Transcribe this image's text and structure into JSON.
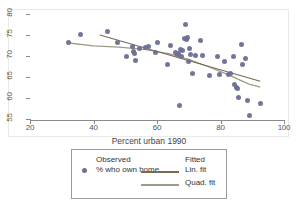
{
  "chart_data": {
    "type": "scatter",
    "title": "",
    "xlabel": "Percent urban 1990",
    "ylabel": "",
    "xlim": [
      20,
      100
    ],
    "ylim": [
      55,
      80
    ],
    "xticks": [
      20,
      40,
      60,
      80,
      100
    ],
    "yticks": [
      55,
      60,
      65,
      70,
      75,
      80
    ],
    "grid": false,
    "legend_position": "below-axes",
    "series": [
      {
        "name": "% who own home",
        "type": "scatter",
        "marker": "filled-circle",
        "color": "#6b6f93",
        "points": [
          [
            32.2,
            73.1
          ],
          [
            36.0,
            75.2
          ],
          [
            44.5,
            75.9
          ],
          [
            47.5,
            73.1
          ],
          [
            50.3,
            69.9
          ],
          [
            52.3,
            72.3
          ],
          [
            52.6,
            71.1
          ],
          [
            53.0,
            70.5
          ],
          [
            53.2,
            69.0
          ],
          [
            54.5,
            71.8
          ],
          [
            56.4,
            72.0
          ],
          [
            57.2,
            72.3
          ],
          [
            59.5,
            70.8
          ],
          [
            60.3,
            73.3
          ],
          [
            63.2,
            67.9
          ],
          [
            64.4,
            72.5
          ],
          [
            65.8,
            70.9
          ],
          [
            66.3,
            70.3
          ],
          [
            66.7,
            70.6
          ],
          [
            67.0,
            58.1
          ],
          [
            67.3,
            71.6
          ],
          [
            67.6,
            69.8
          ],
          [
            68.0,
            71.2
          ],
          [
            68.6,
            74.2
          ],
          [
            69.0,
            77.6
          ],
          [
            69.3,
            73.9
          ],
          [
            69.6,
            74.4
          ],
          [
            69.9,
            68.8
          ],
          [
            70.3,
            71.8
          ],
          [
            70.7,
            70.4
          ],
          [
            71.2,
            65.9
          ],
          [
            72.1,
            70.2
          ],
          [
            73.6,
            73.6
          ],
          [
            74.2,
            70.1
          ],
          [
            76.4,
            65.4
          ],
          [
            79.0,
            70.0
          ],
          [
            79.8,
            65.5
          ],
          [
            81.3,
            68.7
          ],
          [
            82.4,
            65.6
          ],
          [
            83.3,
            65.9
          ],
          [
            84.0,
            69.8
          ],
          [
            84.4,
            63.2
          ],
          [
            85.0,
            62.5
          ],
          [
            85.3,
            62.3
          ],
          [
            85.8,
            60.2
          ],
          [
            86.6,
            72.7
          ],
          [
            86.8,
            68.0
          ],
          [
            88.0,
            69.3
          ],
          [
            88.5,
            59.4
          ],
          [
            89.2,
            55.9
          ],
          [
            92.5,
            58.6
          ]
        ]
      },
      {
        "name": "Lin. fit",
        "type": "line",
        "color": "#7a6a52",
        "points": [
          [
            42.0,
            75.0
          ],
          [
            92.5,
            64.0
          ]
        ]
      },
      {
        "name": "Quad. fit",
        "type": "line",
        "color": "#a09a86",
        "points": [
          [
            32.2,
            73.1
          ],
          [
            40.0,
            72.4
          ],
          [
            48.0,
            72.1
          ],
          [
            56.0,
            71.6
          ],
          [
            64.0,
            70.5
          ],
          [
            70.0,
            69.2
          ],
          [
            76.0,
            67.5
          ],
          [
            82.0,
            65.7
          ],
          [
            86.0,
            64.3
          ],
          [
            89.0,
            63.3
          ],
          [
            92.5,
            62.6
          ]
        ]
      }
    ]
  },
  "axes": {
    "x_tick_labels": [
      "20",
      "40",
      "60",
      "80",
      "100"
    ],
    "y_tick_labels": [
      "55",
      "60",
      "65",
      "70",
      "75",
      "80"
    ],
    "x_axis_title": "Percent urban 1990"
  },
  "legend": {
    "header_observed": "Observed",
    "header_fitted": "Fitted",
    "observed_label": "% who own home",
    "lin_fit_label": "Lin. fit",
    "quad_fit_label": "Quad. fit"
  },
  "colors": {
    "marker": "#6b6f93",
    "lin_fit": "#7a6a52",
    "quad_fit": "#a09a86",
    "axis": "#8a8a8a",
    "frame": "#e9e9e9",
    "legend_border": "#9a9a9a"
  }
}
